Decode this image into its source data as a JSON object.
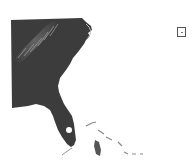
{
  "map": {
    "type": "shaded-relief",
    "region": "Southeastern United States",
    "features": [
      "Appalachian Mountains",
      "Atlantic coast",
      "Florida peninsula",
      "Bahamas",
      "Cuba (partial)"
    ],
    "colors": {
      "land": "#3a3a3a",
      "relief_highlight": "#9a9a9a",
      "water": "#ffffff",
      "islands": "#8a8a8a"
    }
  },
  "legend": {
    "icon": "square-box-icon"
  }
}
